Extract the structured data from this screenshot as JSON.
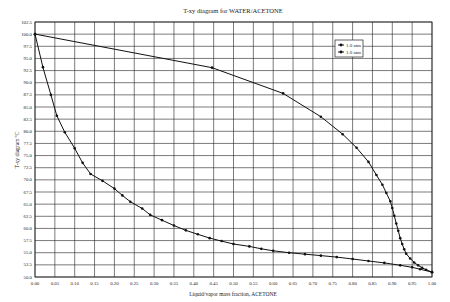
{
  "chart_data": {
    "type": "line",
    "title": "T-xy diagram for WATER/ACETONE",
    "xlabel": "Liquid/vapor mass fraction,  ACETONE",
    "ylabel": "T-xy diagram ºC",
    "xlim": [
      0.0,
      1.0
    ],
    "ylim": [
      50.0,
      102.5
    ],
    "x_ticks": [
      "0.00",
      "0.05",
      "0.10",
      "0.15",
      "0.20",
      "0.25",
      "0.30",
      "0.35",
      "0.40",
      "0.45",
      "0.50",
      "0.55",
      "0.60",
      "0.65",
      "0.70",
      "0.75",
      "0.80",
      "0.85",
      "0.90",
      "0.95",
      "1.00"
    ],
    "y_ticks": [
      "50.0",
      "52.5",
      "55.0",
      "57.5",
      "60.0",
      "62.5",
      "65.0",
      "67.5",
      "70.0",
      "72.5",
      "75.0",
      "77.5",
      "80.0",
      "82.5",
      "85.0",
      "87.5",
      "90.0",
      "92.5",
      "95.0",
      "97.5",
      "100.0",
      "102.5"
    ],
    "grid": true,
    "legend_position": "upper right",
    "legend": [
      "1.0 atm",
      "1.0 atm"
    ],
    "series": [
      {
        "name": "1.0 atm",
        "role": "liquid (bubble point)",
        "x": [
          0.0,
          0.02,
          0.04,
          0.055,
          0.075,
          0.1,
          0.12,
          0.14,
          0.17,
          0.2,
          0.22,
          0.24,
          0.27,
          0.29,
          0.32,
          0.35,
          0.38,
          0.41,
          0.44,
          0.47,
          0.5,
          0.54,
          0.57,
          0.6,
          0.64,
          0.68,
          0.72,
          0.76,
          0.8,
          0.84,
          0.88,
          0.92,
          0.95,
          0.97,
          1.0
        ],
        "y": [
          100.0,
          93.2,
          87.5,
          83.2,
          79.8,
          76.5,
          73.5,
          71.2,
          69.8,
          68.2,
          66.8,
          65.5,
          64.1,
          62.8,
          61.7,
          60.6,
          59.6,
          58.8,
          58.0,
          57.4,
          56.8,
          56.3,
          55.8,
          55.4,
          55.0,
          54.7,
          54.4,
          54.1,
          53.7,
          53.3,
          52.9,
          52.4,
          52.0,
          51.6,
          51.0
        ]
      },
      {
        "name": "1.0 atm",
        "role": "vapor (dew point)",
        "x": [
          0.0,
          0.446,
          0.625,
          0.72,
          0.775,
          0.81,
          0.84,
          0.86,
          0.875,
          0.885,
          0.895,
          0.9,
          0.905,
          0.91,
          0.915,
          0.92,
          0.925,
          0.93,
          0.935,
          0.945,
          0.955,
          0.965,
          0.975,
          0.985,
          1.0
        ],
        "y": [
          100.0,
          93.1,
          87.8,
          83.0,
          79.4,
          76.6,
          73.7,
          71.0,
          69.0,
          67.3,
          65.6,
          64.2,
          62.6,
          61.0,
          59.5,
          58.0,
          56.8,
          55.7,
          54.8,
          53.8,
          53.0,
          52.4,
          51.9,
          51.5,
          51.0
        ]
      }
    ]
  },
  "colors": {
    "line": "#111111",
    "grid": "#222222",
    "background": "#ffffff"
  }
}
